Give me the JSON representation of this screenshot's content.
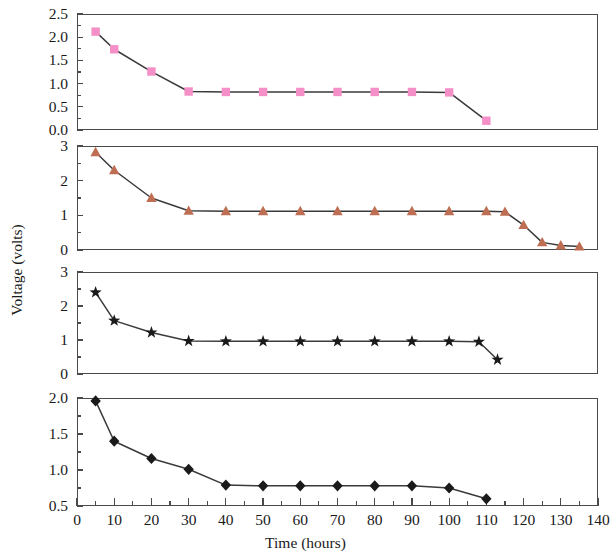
{
  "figure": {
    "y_axis_label": "Voltage (volts)",
    "x_axis_label": "Time (hours)"
  },
  "chart_data": [
    {
      "type": "line",
      "panel": 1,
      "title": "",
      "xlabel": "",
      "ylabel": "Voltage (volts)",
      "xlim": [
        0,
        140
      ],
      "ylim": [
        0.0,
        2.5
      ],
      "xticks": [
        0,
        10,
        20,
        30,
        40,
        50,
        60,
        70,
        80,
        90,
        100,
        110,
        120,
        130,
        140
      ],
      "yticks": [
        0.0,
        0.5,
        1.0,
        1.5,
        2.0,
        2.5
      ],
      "ytick_labels": [
        "0.0",
        "0.5",
        "1.0",
        "1.5",
        "2.0",
        "2.5"
      ],
      "grid": false,
      "legend": "none",
      "marker": "square",
      "marker_color": "#F48FC8",
      "line_color": "#3a3a3a",
      "x": [
        5,
        10,
        20,
        30,
        40,
        50,
        60,
        70,
        80,
        90,
        100,
        110
      ],
      "values": [
        2.12,
        1.74,
        1.26,
        0.83,
        0.82,
        0.82,
        0.82,
        0.82,
        0.82,
        0.82,
        0.81,
        0.2
      ]
    },
    {
      "type": "line",
      "panel": 2,
      "title": "",
      "xlabel": "",
      "ylabel": "Voltage (volts)",
      "xlim": [
        0,
        140
      ],
      "ylim": [
        0,
        3
      ],
      "xticks": [
        0,
        10,
        20,
        30,
        40,
        50,
        60,
        70,
        80,
        90,
        100,
        110,
        120,
        130,
        140
      ],
      "yticks": [
        0,
        1,
        2,
        3
      ],
      "ytick_labels": [
        "0",
        "1",
        "2",
        "3"
      ],
      "grid": false,
      "legend": "none",
      "marker": "triangle",
      "marker_color": "#BE6E52",
      "line_color": "#3a3a3a",
      "x": [
        5,
        10,
        20,
        30,
        40,
        50,
        60,
        70,
        80,
        90,
        100,
        110,
        115,
        120,
        125,
        130,
        135
      ],
      "values": [
        2.82,
        2.3,
        1.5,
        1.13,
        1.12,
        1.12,
        1.12,
        1.12,
        1.12,
        1.12,
        1.12,
        1.12,
        1.1,
        0.72,
        0.22,
        0.13,
        0.1
      ]
    },
    {
      "type": "line",
      "panel": 3,
      "title": "",
      "xlabel": "",
      "ylabel": "Voltage (volts)",
      "xlim": [
        0,
        140
      ],
      "ylim": [
        0,
        3
      ],
      "xticks": [
        0,
        10,
        20,
        30,
        40,
        50,
        60,
        70,
        80,
        90,
        100,
        110,
        120,
        130,
        140
      ],
      "yticks": [
        0,
        1,
        2,
        3
      ],
      "ytick_labels": [
        "0",
        "1",
        "2",
        "3"
      ],
      "grid": false,
      "legend": "none",
      "marker": "star",
      "marker_color": "#1a1a1a",
      "line_color": "#3a3a3a",
      "x": [
        5,
        10,
        20,
        30,
        40,
        50,
        60,
        70,
        80,
        90,
        100,
        108,
        113
      ],
      "values": [
        2.4,
        1.57,
        1.22,
        0.97,
        0.96,
        0.96,
        0.96,
        0.96,
        0.96,
        0.96,
        0.96,
        0.95,
        0.42
      ]
    },
    {
      "type": "line",
      "panel": 4,
      "title": "",
      "xlabel": "Time (hours)",
      "ylabel": "Voltage (volts)",
      "xlim": [
        0,
        140
      ],
      "ylim": [
        0.5,
        2.0
      ],
      "xticks": [
        0,
        10,
        20,
        30,
        40,
        50,
        60,
        70,
        80,
        90,
        100,
        110,
        120,
        130,
        140
      ],
      "yticks": [
        0.5,
        1.0,
        1.5,
        2.0
      ],
      "ytick_labels": [
        "0.5",
        "1.0",
        "1.5",
        "2.0"
      ],
      "grid": false,
      "legend": "none",
      "marker": "diamond",
      "marker_color": "#1a1a1a",
      "line_color": "#3a3a3a",
      "x": [
        5,
        10,
        20,
        30,
        40,
        50,
        60,
        70,
        80,
        90,
        100,
        110
      ],
      "values": [
        1.96,
        1.4,
        1.16,
        1.01,
        0.79,
        0.78,
        0.78,
        0.78,
        0.78,
        0.78,
        0.75,
        0.6
      ]
    }
  ],
  "x_axis": {
    "labels": [
      "0",
      "10",
      "20",
      "30",
      "40",
      "50",
      "60",
      "70",
      "80",
      "90",
      "100",
      "110",
      "120",
      "130",
      "140"
    ],
    "title": "Time (hours)"
  }
}
